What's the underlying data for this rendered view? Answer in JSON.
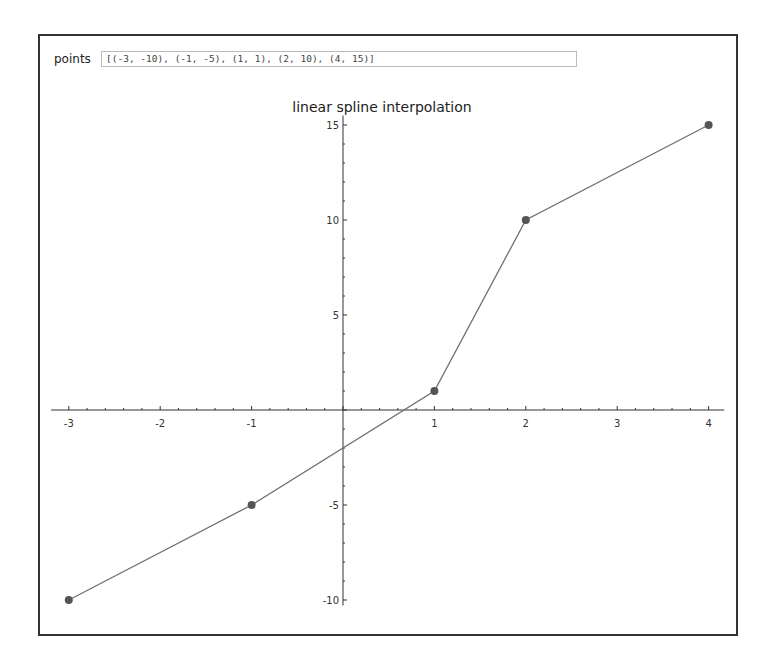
{
  "form": {
    "points_label": "points",
    "points_value": "[(-3, -10), (-1, -5), (1, 1), (2, 10), (4, 15)]"
  },
  "chart_data": {
    "type": "line",
    "title": "linear spline interpolation",
    "xlabel": "",
    "ylabel": "",
    "x": [
      -3,
      -1,
      1,
      2,
      4
    ],
    "y": [
      -10,
      -5,
      1,
      10,
      15
    ],
    "series": [
      {
        "name": "linear spline",
        "x": [
          -3,
          -1,
          1,
          2,
          4
        ],
        "y": [
          -10,
          -5,
          1,
          10,
          15
        ],
        "markers": true
      }
    ],
    "xticks": [
      -3,
      -2,
      -1,
      1,
      2,
      3,
      4
    ],
    "yticks": [
      -10,
      -5,
      5,
      10,
      15
    ],
    "xlim": [
      -3.15,
      4.15
    ],
    "ylim": [
      -10.5,
      15.5
    ],
    "grid": false,
    "legend": "none",
    "colors": {
      "line": "#707070",
      "marker": "#555555",
      "axis": "#333333"
    }
  }
}
